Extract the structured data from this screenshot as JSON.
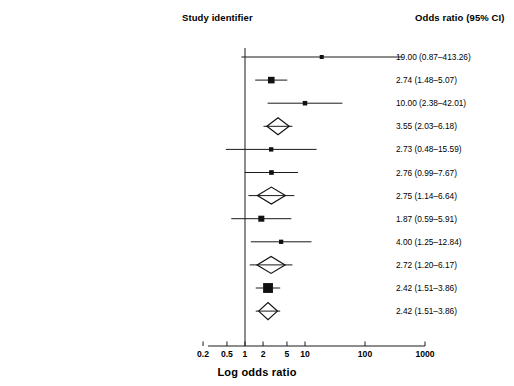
{
  "header": {
    "study_identifier": "Study identifier",
    "odds_ratio": "Odds ratio (95% CI)"
  },
  "axis": {
    "title": "Log odds ratio",
    "ticks": [
      "0.2",
      "0.5",
      "1",
      "2",
      "5",
      "10",
      "100",
      "1000"
    ],
    "tick_values": [
      0.2,
      0.5,
      1,
      2,
      5,
      10,
      100,
      1000
    ],
    "null_line": 1
  },
  "chart_data": {
    "type": "forest",
    "title": "",
    "xlabel": "Log odds ratio",
    "ylabel": "",
    "xscale": "log",
    "xlim": [
      0.2,
      1000
    ],
    "xticks": [
      0.2,
      0.5,
      1,
      2,
      5,
      10,
      100,
      1000
    ],
    "xticklabels": [
      "0.2",
      "0.5",
      "1",
      "2",
      "5",
      "10",
      "100",
      "1000"
    ],
    "reference_line": 1,
    "grid": false,
    "legend": "none",
    "columns": [
      "Study identifier",
      "Odds ratio (95% CI)"
    ],
    "rows": [
      {
        "label": "Black et al., 2001",
        "label_plain": "Black ",
        "label_italic": "et al.",
        "label_tail": ", 2001",
        "marker": "square",
        "size": 0.28,
        "or": 19.0,
        "ci_low": 0.87,
        "ci_high": 413.26,
        "or_text": "19.00 (0.87–413.26)"
      },
      {
        "label": "Bottlender et al., 2002",
        "label_plain": "Bottlender ",
        "label_italic": "et al.",
        "label_tail": ", 2002",
        "marker": "square",
        "size": 1.0,
        "or": 2.74,
        "ci_low": 1.48,
        "ci_high": 5.07,
        "or_text": "2.74 (1.48–5.07)"
      },
      {
        "label": "Verdoux et al.,1999",
        "label_plain": "Verdoux ",
        "label_italic": "et al.",
        "label_tail": ",1999",
        "marker": "square",
        "size": 0.42,
        "or": 10.0,
        "ci_low": 2.38,
        "ci_high": 42.01,
        "or_text": "10.00 (2.38–42.01)"
      },
      {
        "label": "6 month follow-up combined (n = 266)",
        "label_plain": "6 month follow-up combined (",
        "label_italic": "n",
        "label_tail": " = 266)",
        "marker": "diamond",
        "size": 1.0,
        "or": 3.55,
        "ci_low": 2.03,
        "ci_high": 6.18,
        "or_text": "3.55 (2.03–6.18)"
      },
      {
        "label": "Tirupati et al., 2004",
        "label_plain": "Tirupati ",
        "label_italic": "et al.",
        "label_tail": ", 2004",
        "marker": "square",
        "size": 0.38,
        "or": 2.73,
        "ci_low": 0.48,
        "ci_high": 15.59,
        "or_text": "2.73 (0.48–15.59)"
      },
      {
        "label": "Malla et al., 2002",
        "label_plain": "Malla ",
        "label_italic": "et al.",
        "label_tail": ", 2002",
        "marker": "square",
        "size": 0.46,
        "or": 2.76,
        "ci_low": 0.99,
        "ci_high": 7.67,
        "or_text": "2.76 (0.99–7.67)"
      },
      {
        "label": "12 months follow-up combined (n = 133)",
        "label_plain": "12 months follow-up combined (",
        "label_italic": "n",
        "label_tail": " = 133)",
        "marker": "diamond",
        "size": 1.0,
        "or": 2.75,
        "ci_low": 1.14,
        "ci_high": 6.64,
        "or_text": "2.75 (1.14–6.64)"
      },
      {
        "label": "Craig et al., 2000",
        "label_plain": "Craig ",
        "label_italic": "et al.",
        "label_tail": ", 2000",
        "marker": "square",
        "size": 0.84,
        "or": 1.87,
        "ci_low": 0.59,
        "ci_high": 5.91,
        "or_text": "1.87 (0.59–5.91)"
      },
      {
        "label": "Verdoux et al., 1999",
        "label_plain": "Verdoux ",
        "label_italic": "et al.",
        "label_tail": ", 1999",
        "marker": "square",
        "size": 0.36,
        "or": 4.0,
        "ci_low": 1.25,
        "ci_high": 12.84,
        "or_text": "4.00 (1.25–12.84)"
      },
      {
        "label": "24 month follow-up combined (n = 206)",
        "label_plain": "24 month follow-up combined (",
        "label_italic": "n",
        "label_tail": " = 206)",
        "marker": "diamond",
        "size": 1.0,
        "or": 2.72,
        "ci_low": 1.2,
        "ci_high": 6.17,
        "or_text": "2.72 (1.20–6.17)"
      },
      {
        "label": "Huber et al., 1975",
        "label_plain": "Huber ",
        "label_italic": "et al.",
        "label_tail": ", 1975",
        "marker": "square",
        "size": 1.9,
        "or": 2.42,
        "ci_low": 1.51,
        "ci_high": 3.86,
        "or_text": "2.42 (1.51–3.86)"
      },
      {
        "label": "264 month follow-up (Huber et al., only; n = 491)",
        "label_plain": "264 month follow-up (Huber ",
        "label_italic": "et al.",
        "label_tail": ", only; ",
        "label_italic2": "n",
        "label_tail2": " = 491)",
        "marker": "diamond",
        "size": 1.0,
        "or": 2.42,
        "ci_low": 1.51,
        "ci_high": 3.86,
        "or_text": "2.42 (1.51–3.86)"
      }
    ]
  },
  "colors": {
    "text": "#000000",
    "line": "#000000",
    "axis": "#000000"
  }
}
